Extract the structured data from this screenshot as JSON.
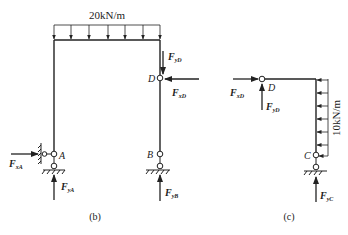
{
  "figure_b": {
    "caption": "(b)",
    "load_label": "20kN/m",
    "node_D": "D",
    "node_A": "A",
    "node_B": "B",
    "forces": {
      "FyD": {
        "main": "F",
        "sub": "yD"
      },
      "FxD": {
        "main": "F",
        "sub": "xD"
      },
      "FxA": {
        "main": "F",
        "sub": "xA"
      },
      "FyA": {
        "main": "F",
        "sub": "yA"
      },
      "FyB": {
        "main": "F",
        "sub": "yB"
      }
    }
  },
  "figure_c": {
    "caption": "(c)",
    "load_label": "10kN/m",
    "node_D": "D",
    "node_C": "C",
    "forces": {
      "FxD": {
        "main": "F",
        "sub": "xD"
      },
      "FyD": {
        "main": "F",
        "sub": "yD"
      },
      "FyC": {
        "main": "F",
        "sub": "yC"
      }
    }
  },
  "colors": {
    "line": "#222222",
    "background": "#ffffff"
  }
}
